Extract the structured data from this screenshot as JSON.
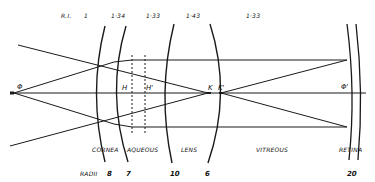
{
  "diagram": {
    "refractive_index": {
      "label": "R.I.",
      "values": [
        "1",
        "1·34",
        "1·33",
        "1·43",
        "1·33"
      ]
    },
    "points": {
      "object": "Φ",
      "principal_1": "H",
      "principal_2": "H'",
      "nodal_1": "K",
      "nodal_2": "K'",
      "image": "Φ'"
    },
    "media": [
      "CORNEA",
      "AQUEOUS",
      "LENS",
      "VITREOUS",
      "RETINA"
    ],
    "radii": {
      "label": "RADII",
      "values": [
        "8",
        "7",
        "10",
        "6",
        "20"
      ]
    },
    "colors": {
      "line": "#1a1a1a",
      "background": "#ffffff"
    }
  }
}
